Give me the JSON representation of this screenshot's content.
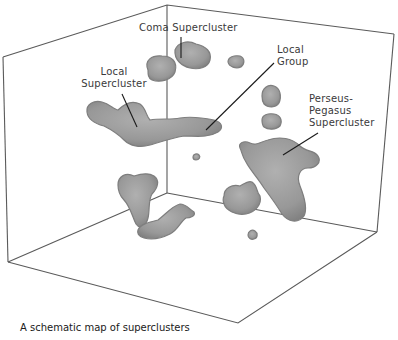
{
  "diagram": {
    "title": "A schematic map of superclusters",
    "colors": {
      "background": "#ffffff",
      "box_lines": "#555555",
      "blob_fill": "#9a9a9a",
      "blob_edge": "#7e7e7e",
      "leader_lines": "#1a1a1a",
      "label_text": "#3a3a3a"
    },
    "labels": {
      "coma": "Coma Supercluster",
      "local_supercluster_line1": "Local",
      "local_supercluster_line2": "Supercluster",
      "local_group_line1": "Local",
      "local_group_line2": "Group",
      "perseus_line1": "Perseus-",
      "perseus_line2": "Pegasus",
      "perseus_line3": "Supercluster"
    }
  }
}
